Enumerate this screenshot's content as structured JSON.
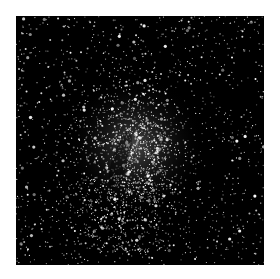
{
  "image": {
    "subject": "star field with dense central star cluster",
    "background_color": "#000000",
    "page_background": "#ffffff",
    "star_color": "#ffffff",
    "cluster_center": [
      0.48,
      0.52
    ],
    "star_count": 2600
  }
}
